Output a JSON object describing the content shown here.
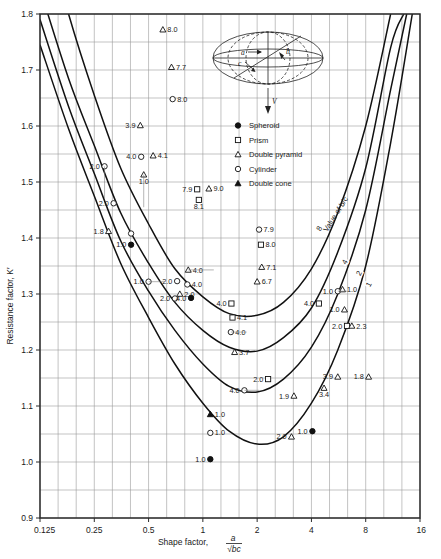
{
  "chart_data": {
    "type": "line",
    "title": "",
    "xlabel": "Shape factor, a/√bc",
    "ylabel": "Resistance factor, K′",
    "xscale": "log2",
    "xlim": [
      0.125,
      16
    ],
    "ylim": [
      0.9,
      1.8
    ],
    "xticks": [
      "0.125",
      "0.25",
      "0.5",
      "1",
      "2",
      "4",
      "8",
      "16"
    ],
    "xtick_values": [
      0.125,
      0.25,
      0.5,
      1,
      2,
      4,
      8,
      16
    ],
    "yticks": [
      "0.9",
      "1.0",
      "1.1",
      "1.2",
      "1.3",
      "1.4",
      "1.5",
      "1.6",
      "1.7",
      "1.8"
    ],
    "ytick_values": [
      0.9,
      1.0,
      1.1,
      1.2,
      1.3,
      1.4,
      1.5,
      1.6,
      1.7,
      1.8
    ],
    "grid": true,
    "minor_grid_y": 0.05,
    "curve_family_label": "Value of b/c",
    "series": [
      {
        "name": "b/c = 8",
        "label": "8",
        "points": [
          [
            0.125,
            1.99
          ],
          [
            0.18,
            1.8
          ],
          [
            0.25,
            1.655
          ],
          [
            0.35,
            1.525
          ],
          [
            0.5,
            1.425
          ],
          [
            0.7,
            1.345
          ],
          [
            1.0,
            1.295
          ],
          [
            1.4,
            1.265
          ],
          [
            2.0,
            1.262
          ],
          [
            2.8,
            1.285
          ],
          [
            4.0,
            1.345
          ],
          [
            5.6,
            1.445
          ],
          [
            8.0,
            1.6
          ],
          [
            11.0,
            1.8
          ]
        ]
      },
      {
        "name": "b/c = 4",
        "label": "4",
        "points": [
          [
            0.125,
            1.845
          ],
          [
            0.18,
            1.685
          ],
          [
            0.25,
            1.565
          ],
          [
            0.35,
            1.445
          ],
          [
            0.5,
            1.355
          ],
          [
            0.7,
            1.285
          ],
          [
            1.0,
            1.235
          ],
          [
            1.4,
            1.205
          ],
          [
            2.0,
            1.198
          ],
          [
            2.8,
            1.222
          ],
          [
            4.0,
            1.275
          ],
          [
            5.6,
            1.375
          ],
          [
            8.0,
            1.525
          ],
          [
            11.0,
            1.74
          ],
          [
            13.0,
            1.8
          ]
        ]
      },
      {
        "name": "b/c = 2",
        "label": "2",
        "points": [
          [
            0.125,
            1.79
          ],
          [
            0.18,
            1.635
          ],
          [
            0.25,
            1.515
          ],
          [
            0.35,
            1.395
          ],
          [
            0.5,
            1.305
          ],
          [
            0.7,
            1.235
          ],
          [
            1.0,
            1.175
          ],
          [
            1.4,
            1.135
          ],
          [
            2.0,
            1.125
          ],
          [
            2.8,
            1.148
          ],
          [
            4.0,
            1.205
          ],
          [
            5.6,
            1.3
          ],
          [
            8.0,
            1.45
          ],
          [
            11.0,
            1.665
          ],
          [
            13.5,
            1.8
          ]
        ]
      },
      {
        "name": "b/c = 1",
        "label": "1",
        "points": [
          [
            0.125,
            1.745
          ],
          [
            0.18,
            1.595
          ],
          [
            0.25,
            1.475
          ],
          [
            0.35,
            1.355
          ],
          [
            0.5,
            1.258
          ],
          [
            0.7,
            1.175
          ],
          [
            1.0,
            1.105
          ],
          [
            1.4,
            1.055
          ],
          [
            2.0,
            1.032
          ],
          [
            2.8,
            1.045
          ],
          [
            4.0,
            1.105
          ],
          [
            5.6,
            1.2
          ],
          [
            8.0,
            1.35
          ],
          [
            11.0,
            1.57
          ],
          [
            14.5,
            1.8
          ]
        ]
      }
    ],
    "data_points": [
      {
        "shape": "double-pyramid",
        "x": 0.6,
        "y": 1.772,
        "label": "8.0",
        "label_side": "right"
      },
      {
        "shape": "double-pyramid",
        "x": 0.67,
        "y": 1.705,
        "label": "7.7",
        "label_side": "right"
      },
      {
        "shape": "cylinder",
        "x": 0.68,
        "y": 1.648,
        "label": "8.0",
        "label_side": "right"
      },
      {
        "shape": "double-pyramid",
        "x": 0.45,
        "y": 1.601,
        "label": "3.9",
        "label_side": "left"
      },
      {
        "shape": "cylinder",
        "x": 0.455,
        "y": 1.545,
        "label": "4.0",
        "label_side": "left"
      },
      {
        "shape": "double-pyramid",
        "x": 0.53,
        "y": 1.547,
        "label": "4.1",
        "label_side": "right"
      },
      {
        "shape": "double-pyramid",
        "x": 0.47,
        "y": 1.513,
        "label": "1.0",
        "label_side": "below"
      },
      {
        "shape": "cylinder",
        "x": 0.285,
        "y": 1.528,
        "label": "2.0",
        "label_side": "left"
      },
      {
        "shape": "cylinder",
        "x": 0.32,
        "y": 1.462,
        "label": "2.0",
        "label_side": "left"
      },
      {
        "shape": "double-pyramid",
        "x": 0.3,
        "y": 1.412,
        "label": "1.8",
        "label_side": "left"
      },
      {
        "shape": "cylinder",
        "x": 0.4,
        "y": 1.408,
        "label": "",
        "label_side": "none"
      },
      {
        "shape": "spheroid",
        "x": 0.4,
        "y": 1.388,
        "label": "1.0",
        "label_side": "left"
      },
      {
        "shape": "prism",
        "x": 0.93,
        "y": 1.487,
        "label": "7.9",
        "label_side": "left"
      },
      {
        "shape": "prism",
        "x": 0.95,
        "y": 1.468,
        "label": "8.1",
        "label_side": "below"
      },
      {
        "shape": "double-pyramid",
        "x": 1.08,
        "y": 1.488,
        "label": "9.0",
        "label_side": "right"
      },
      {
        "shape": "cylinder",
        "x": 2.05,
        "y": 1.415,
        "label": "7.9",
        "label_side": "right"
      },
      {
        "shape": "prism",
        "x": 2.1,
        "y": 1.388,
        "label": "8.0",
        "label_side": "right"
      },
      {
        "shape": "double-pyramid",
        "x": 2.12,
        "y": 1.348,
        "label": "7.1",
        "label_side": "right"
      },
      {
        "shape": "double-pyramid",
        "x": 2.0,
        "y": 1.322,
        "label": "6.7",
        "label_side": "right"
      },
      {
        "shape": "cylinder",
        "x": 0.5,
        "y": 1.322,
        "label": "1.0",
        "label_side": "left"
      },
      {
        "shape": "double-pyramid",
        "x": 0.83,
        "y": 1.343,
        "label": "4.0",
        "label_side": "right"
      },
      {
        "shape": "cylinder",
        "x": 0.82,
        "y": 1.317,
        "label": "4.0",
        "label_side": "right"
      },
      {
        "shape": "cylinder",
        "x": 0.72,
        "y": 1.323,
        "label": "2.0",
        "label_side": "left"
      },
      {
        "shape": "double-pyramid",
        "x": 0.745,
        "y": 1.3,
        "label": "2.0",
        "label_side": "right"
      },
      {
        "shape": "cylinder",
        "x": 0.7,
        "y": 1.292,
        "label": "2.0",
        "label_side": "left"
      },
      {
        "shape": "spheroid",
        "x": 0.86,
        "y": 1.293,
        "label": "4.0",
        "label_side": "left"
      },
      {
        "shape": "prism",
        "x": 1.44,
        "y": 1.283,
        "label": "4.0",
        "label_side": "left"
      },
      {
        "shape": "prism",
        "x": 1.46,
        "y": 1.258,
        "label": "4.1",
        "label_side": "right"
      },
      {
        "shape": "cylinder",
        "x": 1.43,
        "y": 1.232,
        "label": "4.0",
        "label_side": "right"
      },
      {
        "shape": "double-pyramid",
        "x": 1.5,
        "y": 1.196,
        "label": "3.7",
        "label_side": "right"
      },
      {
        "shape": "prism",
        "x": 4.4,
        "y": 1.283,
        "label": "4.0",
        "label_side": "left"
      },
      {
        "shape": "cylinder",
        "x": 5.6,
        "y": 1.305,
        "label": "1.0",
        "label_side": "left"
      },
      {
        "shape": "double-pyramid",
        "x": 5.95,
        "y": 1.308,
        "label": "1.0",
        "label_side": "right"
      },
      {
        "shape": "double-pyramid",
        "x": 6.1,
        "y": 1.272,
        "label": "1.0",
        "label_side": "left"
      },
      {
        "shape": "prism",
        "x": 6.3,
        "y": 1.243,
        "label": "2.0",
        "label_side": "left"
      },
      {
        "shape": "double-pyramid",
        "x": 6.7,
        "y": 1.243,
        "label": "2.3",
        "label_side": "right"
      },
      {
        "shape": "double-pyramid",
        "x": 5.6,
        "y": 1.152,
        "label": "3.9",
        "label_side": "left"
      },
      {
        "shape": "prism",
        "x": 2.3,
        "y": 1.148,
        "label": "2.0",
        "label_side": "left"
      },
      {
        "shape": "double-pyramid",
        "x": 8.3,
        "y": 1.152,
        "label": "1.8",
        "label_side": "left"
      },
      {
        "shape": "double-pyramid",
        "x": 3.2,
        "y": 1.118,
        "label": "1.9",
        "label_side": "left"
      },
      {
        "shape": "double-pyramid",
        "x": 4.7,
        "y": 1.132,
        "label": "3.4",
        "label_side": "below"
      },
      {
        "shape": "cylinder",
        "x": 1.7,
        "y": 1.128,
        "label": "4.0",
        "label_side": "left"
      },
      {
        "shape": "double-cone",
        "x": 1.1,
        "y": 1.085,
        "label": "1.0",
        "label_side": "right"
      },
      {
        "shape": "cylinder",
        "x": 1.1,
        "y": 1.052,
        "label": "1.0",
        "label_side": "right"
      },
      {
        "shape": "double-pyramid",
        "x": 3.1,
        "y": 1.045,
        "label": "2.0",
        "label_side": "left"
      },
      {
        "shape": "spheroid",
        "x": 4.05,
        "y": 1.055,
        "label": "1.0",
        "label_side": "left"
      },
      {
        "shape": "spheroid",
        "x": 1.1,
        "y": 1.005,
        "label": "1.0",
        "label_side": "left"
      }
    ]
  },
  "legend": {
    "items": [
      {
        "marker": "spheroid",
        "label": "Spheroid"
      },
      {
        "marker": "prism",
        "label": "Prism"
      },
      {
        "marker": "double-pyramid",
        "label": "Double pyramid"
      },
      {
        "marker": "cylinder",
        "label": "Cylinder"
      },
      {
        "marker": "double-cone",
        "label": "Double cone"
      }
    ]
  },
  "diagram": {
    "axis_a": "a",
    "axis_b": "b",
    "axis_c": "c",
    "velocity": "V"
  },
  "axis_text": {
    "x_prefix": "Shape factor,",
    "x_numer": "a",
    "x_denom": "√bc",
    "y_label": "Resistance factor, K′"
  },
  "colors": {
    "curve": "#111111",
    "grid": "#9a9a9a",
    "frame": "#2b2b2b",
    "text": "#1a1a1a"
  }
}
